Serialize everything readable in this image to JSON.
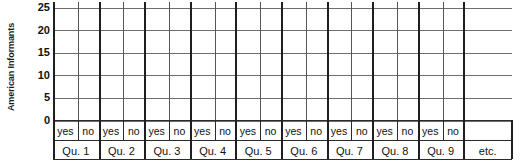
{
  "figure": {
    "axis_title": "American Informants",
    "etc_label": "etc."
  },
  "chart_data": {
    "type": "bar",
    "title": "",
    "subtitle": "",
    "xlabel": "",
    "ylabel": "American Informants",
    "ylim": [
      0,
      25
    ],
    "yticks": [
      0,
      5,
      10,
      15,
      20,
      25
    ],
    "ytick_labels": [
      "0",
      "5",
      "10",
      "15",
      "20",
      "25"
    ],
    "grid": true,
    "legend": false,
    "note": "Empty template grid: no bars are drawn; all categories have no plotted values.",
    "group_labels": [
      "Qu. 1",
      "Qu. 2",
      "Qu. 3",
      "Qu. 4",
      "Qu. 5",
      "Qu. 6",
      "Qu. 7",
      "Qu. 8",
      "Qu. 9",
      "etc."
    ],
    "answer_labels": [
      "yes",
      "no"
    ],
    "categories": [
      "Qu. 1 yes",
      "Qu. 1 no",
      "Qu. 2 yes",
      "Qu. 2 no",
      "Qu. 3 yes",
      "Qu. 3 no",
      "Qu. 4 yes",
      "Qu. 4 no",
      "Qu. 5 yes",
      "Qu. 5 no",
      "Qu. 6 yes",
      "Qu. 6 no",
      "Qu. 7 yes",
      "Qu. 7 no",
      "Qu. 8 yes",
      "Qu. 8 no",
      "Qu. 9 yes",
      "Qu. 9 no"
    ],
    "values": [
      null,
      null,
      null,
      null,
      null,
      null,
      null,
      null,
      null,
      null,
      null,
      null,
      null,
      null,
      null,
      null,
      null,
      null
    ],
    "colors": {
      "background": "#ffffff",
      "gridline": "#6d6d6d",
      "axis": "#1f1f1f",
      "text": "#111111"
    }
  },
  "groups": [
    {
      "label": "Qu. 1",
      "yes": "yes",
      "no": "no"
    },
    {
      "label": "Qu. 2",
      "yes": "yes",
      "no": "no"
    },
    {
      "label": "Qu. 3",
      "yes": "yes",
      "no": "no"
    },
    {
      "label": "Qu. 4",
      "yes": "yes",
      "no": "no"
    },
    {
      "label": "Qu. 5",
      "yes": "yes",
      "no": "no"
    },
    {
      "label": "Qu. 6",
      "yes": "yes",
      "no": "no"
    },
    {
      "label": "Qu. 7",
      "yes": "yes",
      "no": "no"
    },
    {
      "label": "Qu. 8",
      "yes": "yes",
      "no": "no"
    },
    {
      "label": "Qu. 9",
      "yes": "yes",
      "no": "no"
    }
  ]
}
